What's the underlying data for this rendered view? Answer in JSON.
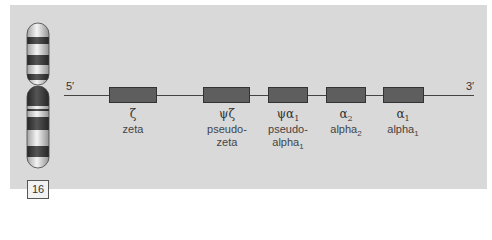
{
  "chromosome": {
    "number": "16"
  },
  "dna": {
    "five_prime": "5′",
    "three_prime": "3′"
  },
  "genes": [
    {
      "symbol": "ζ",
      "name_line1": "zeta",
      "name_line2": "",
      "left": 109,
      "width": 48
    },
    {
      "symbol": "ψζ",
      "name_line1": "pseudo-",
      "name_line2": "zeta",
      "left": 203,
      "width": 47
    },
    {
      "symbol": "ψα",
      "symbol_sub": "1",
      "name_line1": "pseudo-",
      "name_line2": "alpha",
      "name_sub": "1",
      "left": 268,
      "width": 40
    },
    {
      "symbol": "α",
      "symbol_sub": "2",
      "name_line1": "alpha",
      "name_sub": "2",
      "left": 326,
      "width": 40
    },
    {
      "symbol": "α",
      "symbol_sub": "1",
      "name_line1": "alpha",
      "name_sub": "1",
      "left": 383,
      "width": 41
    }
  ],
  "colors": {
    "panel": "#d9d9d9",
    "gene_box": "#5e5e5e",
    "band_dark": "#3a3a3a"
  }
}
